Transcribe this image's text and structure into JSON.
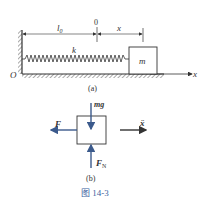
{
  "figure": {
    "caption": "图 14-3",
    "colors": {
      "line": "#333333",
      "force_arrow": "#3b5a8c",
      "caption": "#3b5fa0"
    }
  },
  "panel_a": {
    "sublabel": "(a)",
    "origin_label": "O",
    "axis_label": "x",
    "natural_length_label": "l0",
    "natural_length_main": "l",
    "natural_length_sub": "0",
    "zero_mark_label": "0",
    "displacement_label": "x",
    "spring_label": "k",
    "mass_label": "m"
  },
  "panel_b": {
    "sublabel": "(b)",
    "gravity_label": "mg",
    "spring_force_label": "F",
    "normal_force_main": "F",
    "normal_force_sub": "N",
    "acceleration_label": "ẍ"
  }
}
